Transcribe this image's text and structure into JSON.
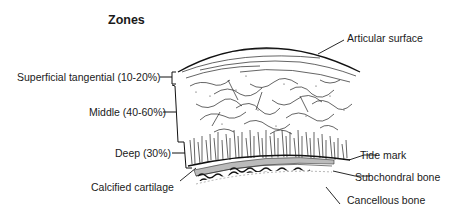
{
  "figure": {
    "title": "Zones",
    "zones": [
      {
        "label": "Superficial tangential (10-20%)"
      },
      {
        "label": "Middle (40-60%)"
      },
      {
        "label": "Deep (30%)"
      }
    ],
    "structures": [
      {
        "label": "Articular surface"
      },
      {
        "label": "Tide mark"
      },
      {
        "label": "Subchondral bone"
      },
      {
        "label": "Cancellous bone"
      },
      {
        "label": "Calcified cartilage"
      }
    ]
  }
}
